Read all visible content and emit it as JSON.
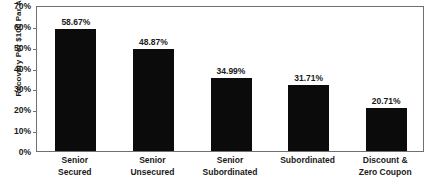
{
  "chart_data": {
    "type": "bar",
    "title": "",
    "subtitle": "",
    "xlabel": "",
    "ylabel": "Recovery Per $100 Par Amount",
    "ylim": [
      0,
      70
    ],
    "ytick_step": 10,
    "grid": false,
    "legend": null,
    "bar_color": "#0b0b0b",
    "axis_color": "#6f6f6f",
    "text_color": "#1a1a1a",
    "categories": [
      "Senior Secured",
      "Senior Unsecured",
      "Senior Subordinated",
      "Subordinated",
      "Discount & Zero Coupon"
    ],
    "category_lines": [
      [
        "Senior",
        "Secured"
      ],
      [
        "Senior",
        "Unsecured"
      ],
      [
        "Senior",
        "Subordinated"
      ],
      [
        "Subordinated",
        ""
      ],
      [
        "Discount &",
        "Zero Coupon"
      ]
    ],
    "values": [
      58.67,
      48.87,
      34.99,
      31.71,
      20.71
    ],
    "value_labels": [
      "58.67%",
      "48.87%",
      "34.99%",
      "31.71%",
      "20.71%"
    ],
    "yticklabels": [
      "70%",
      "60%",
      "50%",
      "40%",
      "30%",
      "20%",
      "10%",
      "0%"
    ],
    "ytickvalues": [
      70,
      60,
      50,
      40,
      30,
      20,
      10,
      0
    ]
  }
}
